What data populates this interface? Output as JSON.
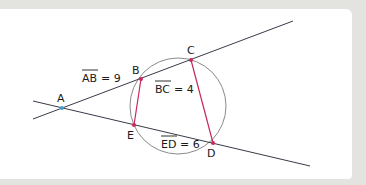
{
  "diagram": {
    "type": "secant-secant theorem figure",
    "points": {
      "A": {
        "label": "A",
        "x": 62,
        "y": 108
      },
      "B": {
        "label": "B",
        "x": 141,
        "y": 79
      },
      "C": {
        "label": "C",
        "x": 191,
        "y": 60
      },
      "E": {
        "label": "E",
        "x": 134,
        "y": 125
      },
      "D": {
        "label": "D",
        "x": 213,
        "y": 143
      }
    },
    "segments": {
      "AB": {
        "name": "AB",
        "value": "9",
        "text": "= 9"
      },
      "BC": {
        "name": "BC",
        "value": "4",
        "text": "= 4"
      },
      "ED": {
        "name": "ED",
        "value": "6",
        "text": "= 6"
      }
    },
    "colors": {
      "line": "#3a3a4a",
      "chord": "#c8285a",
      "circle": "#8a8a8a",
      "point_A": "#3fa0d0",
      "point": "#c8285a",
      "background": "#e3e3df",
      "panel": "#ffffff"
    }
  }
}
